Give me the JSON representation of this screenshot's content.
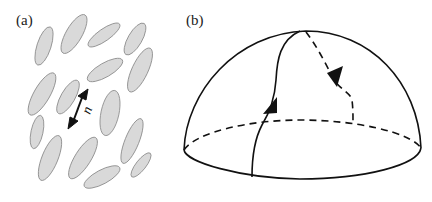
{
  "figure": {
    "panels": [
      {
        "id": "a",
        "label": "(a)",
        "description": "Elongated grey ellipses (rod-like molecules) with aligned orientation; a double-headed arrow marks the director",
        "director_label": "n",
        "colors": {
          "ellipse_fill": "#d9d9d9",
          "ellipse_stroke": "#8a8a8a",
          "arrow": "#111111"
        }
      },
      {
        "id": "b",
        "label": "(b)",
        "description": "Hemisphere with a closed path: solid line rising from the front equator to the pole, dashed line descending on the back side to the equator, with arrowheads",
        "colors": {
          "line": "#111111",
          "background": "#ffffff"
        }
      }
    ]
  }
}
